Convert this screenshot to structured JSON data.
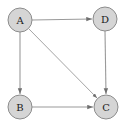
{
  "figure": {
    "background_color": "#ffffff",
    "width": 124,
    "height": 127
  },
  "style": {
    "node_fill": "#d5d5d5",
    "node_stroke": "#8c8c8c",
    "edge_color": "#9a9a9a",
    "label_color": "#1a1a1a",
    "node_radius": 12
  },
  "graph": {
    "type": "directed",
    "nodes": [
      {
        "id": "A",
        "label": "A",
        "cx": 20,
        "cy": 20,
        "r": 12
      },
      {
        "id": "D",
        "label": "D",
        "cx": 105,
        "cy": 19,
        "r": 12
      },
      {
        "id": "B",
        "label": "B",
        "cx": 20,
        "cy": 107,
        "r": 12
      },
      {
        "id": "C",
        "label": "C",
        "cx": 106,
        "cy": 107,
        "r": 12
      }
    ],
    "edges": [
      {
        "id": "A-D",
        "from": "A",
        "to": "D",
        "directed": true,
        "x1": 32,
        "y1": 20,
        "x2": 92,
        "y2": 19
      },
      {
        "id": "A-B",
        "from": "A",
        "to": "B",
        "directed": true,
        "x1": 20,
        "y1": 32,
        "x2": 20,
        "y2": 94
      },
      {
        "id": "A-C",
        "from": "A",
        "to": "C",
        "directed": true,
        "x1": 29,
        "y1": 29,
        "x2": 97,
        "y2": 98
      },
      {
        "id": "D-C",
        "from": "D",
        "to": "C",
        "directed": true,
        "x1": 105,
        "y1": 31,
        "x2": 106,
        "y2": 94
      },
      {
        "id": "B-C",
        "from": "B",
        "to": "C",
        "directed": true,
        "x1": 32,
        "y1": 107,
        "x2": 93,
        "y2": 107
      }
    ]
  }
}
